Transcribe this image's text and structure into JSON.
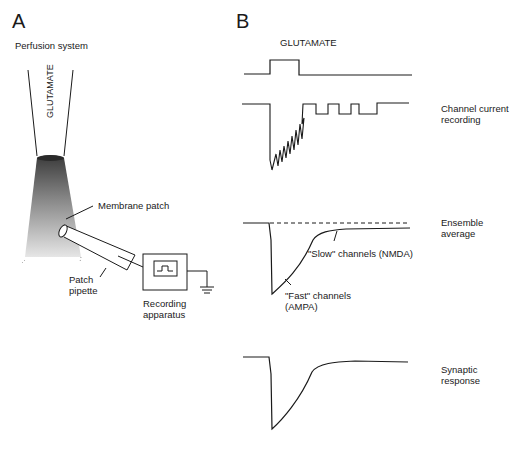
{
  "panelA": {
    "letter": "A",
    "title": "Perfusion system",
    "tube_label": "GLUTAMATE",
    "membrane_label": "Membrane patch",
    "pipette_label": [
      "Patch",
      "pipette"
    ],
    "recorder_label": [
      "Recording",
      "apparatus"
    ]
  },
  "panelB": {
    "letter": "B",
    "stimulus_label": "GLUTAMATE",
    "traces": [
      {
        "name": "glutamate-pulse",
        "label": []
      },
      {
        "name": "channel-current",
        "label": [
          "Channel current",
          "recording"
        ]
      },
      {
        "name": "ensemble-average",
        "label": [
          "Ensemble",
          "average"
        ]
      },
      {
        "name": "synaptic-response",
        "label": [
          "Synaptic",
          "response"
        ]
      }
    ],
    "slow_label": "\"Slow\" channels (NMDA)",
    "fast_label": [
      "\"Fast\" channels",
      "(AMPA)"
    ]
  }
}
